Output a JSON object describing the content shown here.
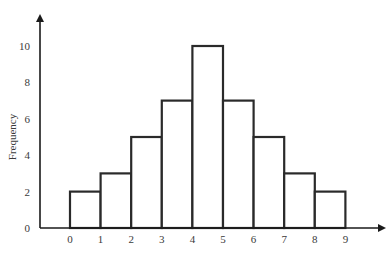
{
  "chart_data": {
    "type": "bar",
    "subtype": "histogram",
    "title": "",
    "xlabel": "",
    "ylabel": "Frequency",
    "bin_edges": [
      0,
      1,
      2,
      3,
      4,
      5,
      6,
      7,
      8,
      9
    ],
    "categories": [
      "0-1",
      "1-2",
      "2-3",
      "3-4",
      "4-5",
      "5-6",
      "6-7",
      "7-8",
      "8-9"
    ],
    "values": [
      2,
      3,
      5,
      7,
      10,
      7,
      5,
      3,
      2
    ],
    "x_ticks": [
      "0",
      "1",
      "2",
      "3",
      "4",
      "5",
      "6",
      "7",
      "8",
      "9"
    ],
    "y_ticks": [
      "0",
      "2",
      "4",
      "6",
      "8",
      "10"
    ],
    "xlim": [
      -1,
      10.5
    ],
    "ylim": [
      0,
      11.5
    ],
    "grid": false,
    "legend": null,
    "colors": {
      "bar_fill": "#ffffff",
      "bar_stroke": "#2a2a2a",
      "axis": "#1a1a1a",
      "text": "#3a3a3a"
    }
  }
}
